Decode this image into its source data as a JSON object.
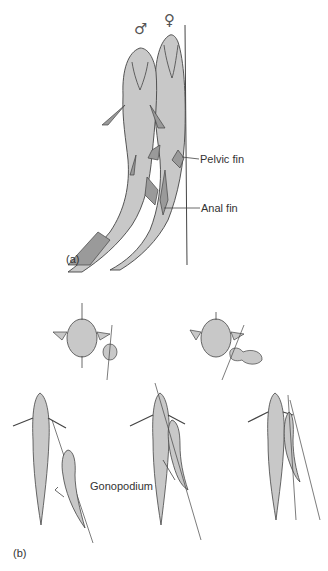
{
  "figure": {
    "panel_a": {
      "label": "(a)",
      "male_symbol": "♂",
      "female_symbol": "♀",
      "callouts": {
        "pelvic_fin": "Pelvic fin",
        "anal_fin": "Anal fin"
      }
    },
    "panel_b": {
      "label": "(b)",
      "callouts": {
        "gonopodium": "Gonopodium"
      }
    },
    "colors": {
      "fish_fill": "#c8c8c8",
      "outline": "#444444",
      "fin_fill": "#9a9a9a",
      "text": "#333333"
    }
  }
}
